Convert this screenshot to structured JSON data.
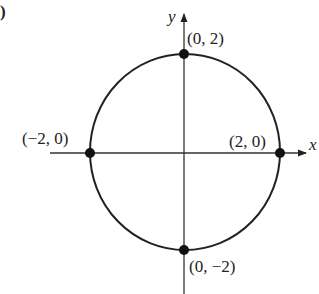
{
  "figure": {
    "panel_label": ")",
    "axes": {
      "x_label": "x",
      "y_label": "y"
    },
    "curve": {
      "type": "circle",
      "center": [
        0,
        0
      ],
      "radius": 2
    },
    "points": [
      {
        "label": "(0, 2)",
        "x": 0,
        "y": 2
      },
      {
        "label": "(2, 0)",
        "x": 2,
        "y": 0
      },
      {
        "label": "(−2, 0)",
        "x": -2,
        "y": 0
      },
      {
        "label": "(0, −2)",
        "x": 0,
        "y": -2
      }
    ],
    "colors": {
      "stroke": "#222222",
      "point": "#111111"
    }
  }
}
